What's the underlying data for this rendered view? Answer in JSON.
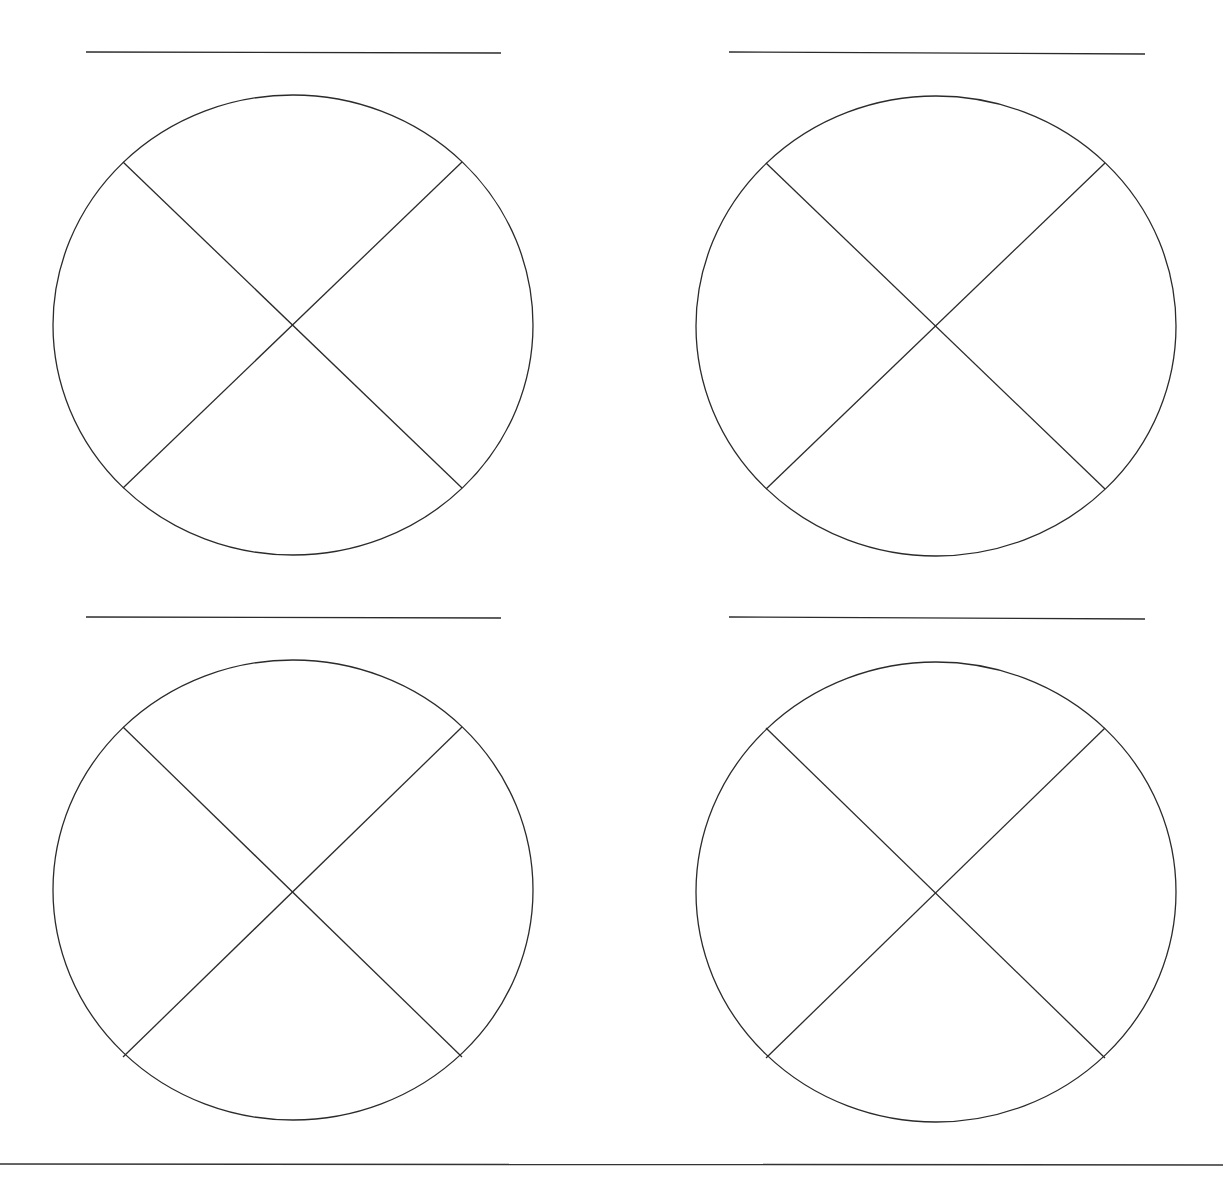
{
  "worksheet": {
    "type": "quadrant-circle-organizer",
    "stroke_color": "#2b2b2b",
    "background": "#ffffff",
    "panels": [
      {
        "id": "top-left",
        "title_line": {
          "x1": 86,
          "y1": 52,
          "x2": 501,
          "y2": 53
        },
        "circle": {
          "cx": 293,
          "cy": 325,
          "rx": 240,
          "ry": 230
        },
        "dividers": [
          {
            "x1": 123,
            "y1": 162,
            "x2": 462,
            "y2": 488
          },
          {
            "x1": 462,
            "y1": 162,
            "x2": 123,
            "y2": 488
          }
        ]
      },
      {
        "id": "top-right",
        "title_line": {
          "x1": 729,
          "y1": 52,
          "x2": 1145,
          "y2": 54
        },
        "circle": {
          "cx": 936,
          "cy": 326,
          "rx": 240,
          "ry": 230
        },
        "dividers": [
          {
            "x1": 766,
            "y1": 163,
            "x2": 1105,
            "y2": 489
          },
          {
            "x1": 1105,
            "y1": 163,
            "x2": 766,
            "y2": 489
          }
        ]
      },
      {
        "id": "bottom-left",
        "title_line": {
          "x1": 86,
          "y1": 617,
          "x2": 501,
          "y2": 618
        },
        "circle": {
          "cx": 293,
          "cy": 890,
          "rx": 240,
          "ry": 230
        },
        "dividers": [
          {
            "x1": 123,
            "y1": 727,
            "x2": 462,
            "y2": 1057
          },
          {
            "x1": 462,
            "y1": 727,
            "x2": 123,
            "y2": 1057
          }
        ]
      },
      {
        "id": "bottom-right",
        "title_line": {
          "x1": 729,
          "y1": 617,
          "x2": 1145,
          "y2": 619
        },
        "circle": {
          "cx": 936,
          "cy": 892,
          "rx": 240,
          "ry": 230
        },
        "dividers": [
          {
            "x1": 766,
            "y1": 728,
            "x2": 1105,
            "y2": 1058
          },
          {
            "x1": 1105,
            "y1": 728,
            "x2": 766,
            "y2": 1058
          }
        ]
      }
    ],
    "footer_line": {
      "x1": 0,
      "y1": 1164,
      "x2": 1223,
      "y2": 1165
    }
  }
}
